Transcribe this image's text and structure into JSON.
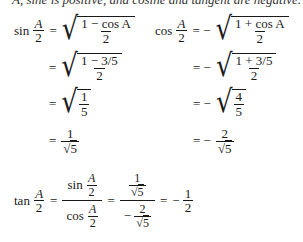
{
  "header_fragment": "A, sine is positive, and cosine and tangent are negative.",
  "left_column": {
    "lhs_func": "sin",
    "lhs_num": "A",
    "lhs_den": "2",
    "steps": [
      {
        "prefix": "=",
        "type": "sqrt-frac",
        "num": "1 − cos A",
        "den": "2"
      },
      {
        "prefix": "=",
        "type": "sqrt-frac",
        "num": "1 − 3/5",
        "den": "2"
      },
      {
        "prefix": "=",
        "type": "sqrt-frac",
        "num": "1",
        "den": "5"
      },
      {
        "prefix": "=",
        "type": "frac-sqrtden",
        "num": "1",
        "den": "5"
      }
    ]
  },
  "right_column": {
    "lhs_func": "cos",
    "lhs_num": "A",
    "lhs_den": "2",
    "steps": [
      {
        "prefix": "= −",
        "type": "sqrt-frac",
        "num": "1 + cos A",
        "den": "2"
      },
      {
        "prefix": "= −",
        "type": "sqrt-frac",
        "num": "1 + 3/5",
        "den": "2"
      },
      {
        "prefix": "= −",
        "type": "sqrt-frac",
        "num": "4",
        "den": "5"
      },
      {
        "prefix": "= −",
        "type": "frac-sqrtden",
        "num": "2",
        "den": "5"
      }
    ]
  },
  "tangent": {
    "lhs_func": "tan",
    "lhs_num": "A",
    "lhs_den": "2",
    "ratio_top_func": "sin",
    "ratio_bottom_func": "cos",
    "half_num": "A",
    "half_den": "2",
    "value_top_num": "1",
    "value_top_den": "5",
    "value_bottom_sign": "−",
    "value_bottom_num": "2",
    "value_bottom_den": "5",
    "result_sign": "− ",
    "result_num": "1",
    "result_den": "2",
    "equals": "="
  },
  "symbols": {
    "sqrt": "√",
    "equals": "="
  }
}
